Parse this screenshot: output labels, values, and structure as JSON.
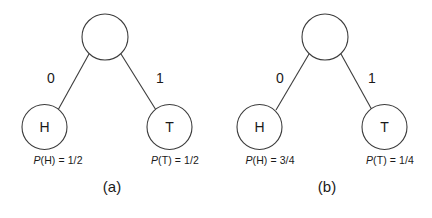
{
  "figure": {
    "background_color": "#ffffff",
    "stroke_color": "#3c3c3c",
    "text_color": "#1a1a1a"
  },
  "panels": [
    {
      "caption": "(a)",
      "root": {
        "label": "",
        "cx": 105,
        "cy": 37,
        "r": 23
      },
      "left_branch_label": "0",
      "right_branch_label": "1",
      "leaves": [
        {
          "label": "H",
          "cx": 44.5,
          "cy": 127,
          "r": 22.5,
          "probability": "P(H) = 1/2",
          "prob_symbol": "P",
          "prob_rest": "(H) = 1/2"
        },
        {
          "label": "T",
          "cx": 169.5,
          "cy": 127,
          "r": 22.5,
          "probability": "P(T) = 1/2",
          "prob_symbol": "P",
          "prob_rest": "(T) = 1/2"
        }
      ]
    },
    {
      "caption": "(b)",
      "root": {
        "label": "",
        "cx": 325,
        "cy": 37,
        "r": 23
      },
      "left_branch_label": "0",
      "right_branch_label": "1",
      "leaves": [
        {
          "label": "H",
          "cx": 259.5,
          "cy": 127,
          "r": 22.5,
          "probability": "P(H) = 3/4",
          "prob_symbol": "P",
          "prob_rest": "(H) = 3/4"
        },
        {
          "label": "T",
          "cx": 384.5,
          "cy": 127,
          "r": 22.5,
          "probability": "P(T) = 1/4",
          "prob_symbol": "P",
          "prob_rest": "(T) = 1/4"
        }
      ]
    }
  ],
  "geometry": {
    "panel_a": {
      "left_edge": {
        "x1": 89,
        "y1": 54,
        "x2": 58,
        "y2": 110
      },
      "right_edge": {
        "x1": 121,
        "y1": 54,
        "x2": 156,
        "y2": 110
      },
      "left_branch_label_pos": {
        "x": 51,
        "y": 83
      },
      "right_branch_label_pos": {
        "x": 160,
        "y": 83
      },
      "prob_left_pos": {
        "x": 58,
        "y": 160
      },
      "prob_right_pos": {
        "x": 175,
        "y": 160
      },
      "caption_pos": {
        "x": 112,
        "y": 182
      }
    },
    "panel_b": {
      "left_edge": {
        "x1": 309,
        "y1": 54,
        "x2": 276,
        "y2": 110
      },
      "right_edge": {
        "x1": 341,
        "y1": 54,
        "x2": 372,
        "y2": 110
      },
      "left_branch_label_pos": {
        "x": 280,
        "y": 83
      },
      "right_branch_label_pos": {
        "x": 372,
        "y": 83
      },
      "prob_left_pos": {
        "x": 270,
        "y": 160
      },
      "prob_right_pos": {
        "x": 390,
        "y": 160
      },
      "caption_pos": {
        "x": 327,
        "y": 182
      }
    }
  }
}
